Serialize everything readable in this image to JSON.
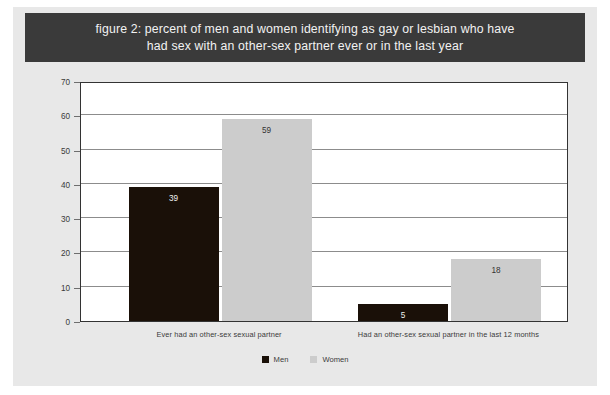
{
  "figure": {
    "title": "figure 2: percent of men and women identifying as gay or lesbian who have had sex with an other-sex partner ever or in the last year",
    "title_line1": "figure 2: percent of men and women identifying as gay or lesbian who have",
    "title_line2": "had sex with an other-sex partner ever or in the last year",
    "title_band_color": "#3a3a3a",
    "card_color": "#e8e8e8"
  },
  "chart_data": {
    "type": "bar",
    "title": "figure 2: percent of men and women identifying as gay or lesbian who have had sex with an other-sex partner ever or in the last year",
    "xlabel": "",
    "ylabel": "Percent of men and women identifying as gay or lesbian",
    "ylim": [
      0,
      70
    ],
    "yticks": [
      0,
      10,
      20,
      30,
      40,
      50,
      60,
      70
    ],
    "ytick_labels": [
      "0",
      "10",
      "20",
      "30",
      "40",
      "50",
      "60",
      "70"
    ],
    "grid": true,
    "grid_axis": "y",
    "legend_position": "bottom",
    "categories": [
      "Ever had an other-sex sexual partner",
      "Had an other-sex sexual partner in the last 12 months"
    ],
    "series": [
      {
        "name": "Men",
        "color": "#1a1008",
        "values": [
          39,
          5
        ],
        "labels": [
          "39",
          "5"
        ]
      },
      {
        "name": "Women",
        "color": "#cccccc",
        "values": [
          59,
          18
        ],
        "labels": [
          "59",
          "18"
        ]
      }
    ]
  },
  "legend": {
    "items": [
      {
        "label": "Men",
        "color": "#1a1008"
      },
      {
        "label": "Women",
        "color": "#cccccc"
      }
    ]
  }
}
